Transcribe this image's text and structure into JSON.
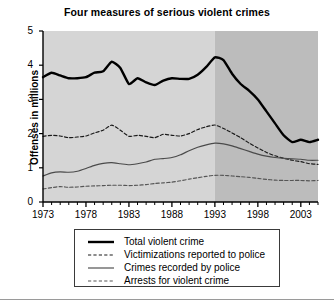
{
  "chart_data": {
    "type": "line",
    "title": "Four measures of serious violent crimes",
    "xlabel": "",
    "ylabel": "Offenses in millions",
    "xlim": [
      1973,
      2005
    ],
    "ylim": [
      0,
      5
    ],
    "yticks": [
      "0",
      "1",
      "2",
      "3",
      "4",
      "5"
    ],
    "xticks": [
      "1973",
      "1978",
      "1983",
      "1988",
      "1993",
      "1998",
      "2003"
    ],
    "grid": false,
    "legend_position": "below-plot",
    "minor_tick_interval": 1,
    "background_bands": [
      {
        "from": 1973,
        "to": 1993,
        "color": "#d5d5d5"
      },
      {
        "from": 1993,
        "to": 2005,
        "color": "#bcbcbc"
      }
    ],
    "x": [
      1973,
      1974,
      1975,
      1976,
      1977,
      1978,
      1979,
      1980,
      1981,
      1982,
      1983,
      1984,
      1985,
      1986,
      1987,
      1988,
      1989,
      1990,
      1991,
      1992,
      1993,
      1994,
      1995,
      1996,
      1997,
      1998,
      1999,
      2000,
      2001,
      2002,
      2003,
      2004,
      2005
    ],
    "series": [
      {
        "name": "Total violent crime",
        "style": "solid",
        "width": "thick",
        "color": "#000000",
        "values": [
          3.65,
          3.78,
          3.7,
          3.62,
          3.62,
          3.65,
          3.78,
          3.82,
          4.1,
          3.92,
          3.45,
          3.62,
          3.5,
          3.42,
          3.55,
          3.62,
          3.6,
          3.6,
          3.72,
          3.95,
          4.23,
          4.15,
          3.75,
          3.45,
          3.25,
          3.0,
          2.65,
          2.3,
          1.95,
          1.75,
          1.82,
          1.75,
          1.82
        ]
      },
      {
        "name": "Victimizations reported to police",
        "style": "dashed",
        "width": "thin",
        "color": "#1a1a1a",
        "values": [
          1.92,
          1.95,
          1.93,
          1.88,
          1.9,
          1.93,
          2.02,
          2.1,
          2.25,
          2.1,
          1.92,
          1.95,
          1.92,
          1.88,
          1.98,
          1.95,
          1.93,
          2.0,
          2.12,
          2.2,
          2.25,
          2.15,
          2.02,
          1.88,
          1.72,
          1.58,
          1.45,
          1.35,
          1.28,
          1.22,
          1.18,
          1.12,
          1.1
        ]
      },
      {
        "name": "Crimes recorded by police",
        "style": "solid",
        "width": "thin",
        "color": "#4a4a4a",
        "values": [
          0.76,
          0.85,
          0.88,
          0.87,
          0.9,
          0.98,
          1.07,
          1.13,
          1.15,
          1.12,
          1.09,
          1.12,
          1.17,
          1.25,
          1.27,
          1.3,
          1.38,
          1.5,
          1.6,
          1.67,
          1.72,
          1.7,
          1.64,
          1.56,
          1.48,
          1.4,
          1.34,
          1.3,
          1.28,
          1.26,
          1.25,
          1.22,
          1.22
        ]
      },
      {
        "name": "Arrests for violent crime",
        "style": "dashed",
        "width": "thin",
        "color": "#555555",
        "values": [
          0.38,
          0.42,
          0.45,
          0.43,
          0.44,
          0.46,
          0.47,
          0.48,
          0.49,
          0.49,
          0.48,
          0.49,
          0.51,
          0.54,
          0.56,
          0.58,
          0.62,
          0.67,
          0.71,
          0.75,
          0.78,
          0.78,
          0.76,
          0.74,
          0.72,
          0.69,
          0.66,
          0.64,
          0.63,
          0.63,
          0.63,
          0.62,
          0.63
        ]
      }
    ]
  },
  "legend": {
    "items": [
      {
        "label": "Total violent crime",
        "style": "solid",
        "width": "thick"
      },
      {
        "label": "Victimizations reported to police",
        "style": "dashed",
        "width": "thin"
      },
      {
        "label": "Crimes recorded by police",
        "style": "solid",
        "width": "thin"
      },
      {
        "label": "Arrests for violent crime",
        "style": "dashed",
        "width": "thin"
      }
    ]
  }
}
